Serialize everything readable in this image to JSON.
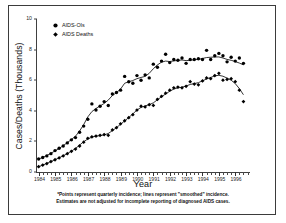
{
  "figure": {
    "title": "",
    "xlabel": "Year",
    "ylabel": "Cases/Deaths (Thousands)"
  },
  "legend": {
    "items": [
      {
        "label": "AIDS-OIs",
        "marker": "circle-marker",
        "color": "#000000"
      },
      {
        "label": "AIDS Deaths",
        "marker": "diamond-marker",
        "color": "#000000"
      }
    ]
  },
  "footnote": {
    "line1": "*Points represent quarterly incidence; lines represent \"smoothed\" incidence.",
    "line2": "Estimates are not adjusted for incomplete reporting of diagnosed AIDS cases."
  },
  "axes": {
    "y_ticks": [
      "0",
      "2",
      "4",
      "6",
      "8",
      "10"
    ],
    "x_ticks": [
      "1984",
      "1985",
      "1986",
      "1987",
      "1988",
      "1989",
      "1990",
      "1991",
      "1992",
      "1993",
      "1994",
      "1995",
      "1996"
    ]
  },
  "chart_data": {
    "type": "scatter",
    "title": "",
    "xlabel": "Year",
    "ylabel": "Cases/Deaths (Thousands)",
    "xlim": [
      1983.9,
      1996.9
    ],
    "ylim": [
      0,
      10
    ],
    "grid": false,
    "legend_position": "top-left",
    "note": "Quarterly incidence points with smoothed trend lines overlaid. x values are quarter midpoints in decimal years.",
    "x": [
      1984.0,
      1984.25,
      1984.5,
      1984.75,
      1985.0,
      1985.25,
      1985.5,
      1985.75,
      1986.0,
      1986.25,
      1986.5,
      1986.75,
      1987.0,
      1987.25,
      1987.5,
      1987.75,
      1988.0,
      1988.25,
      1988.5,
      1988.75,
      1989.0,
      1989.25,
      1989.5,
      1989.75,
      1990.0,
      1990.25,
      1990.5,
      1990.75,
      1991.0,
      1991.25,
      1991.5,
      1991.75,
      1992.0,
      1992.25,
      1992.5,
      1992.75,
      1993.0,
      1993.25,
      1993.5,
      1993.75,
      1994.0,
      1994.25,
      1994.5,
      1994.75,
      1995.0,
      1995.25,
      1995.5,
      1995.75,
      1996.0,
      1996.25,
      1996.5
    ],
    "series": [
      {
        "name": "AIDS-OIs",
        "marker": "circle",
        "color": "#000000",
        "values": [
          0.85,
          0.95,
          1.05,
          1.2,
          1.4,
          1.55,
          1.7,
          1.9,
          2.1,
          2.25,
          2.6,
          3.0,
          3.45,
          4.45,
          4.05,
          4.3,
          4.6,
          4.35,
          5.1,
          5.2,
          5.35,
          6.25,
          5.9,
          5.8,
          6.3,
          6.0,
          6.35,
          6.15,
          7.05,
          6.85,
          7.25,
          7.7,
          7.15,
          7.35,
          7.3,
          7.45,
          7.1,
          7.35,
          7.35,
          7.4,
          7.35,
          7.95,
          7.35,
          7.6,
          7.75,
          7.6,
          7.2,
          7.5,
          7.25,
          7.45,
          7.1
        ],
        "smoothed": [
          0.85,
          0.95,
          1.08,
          1.22,
          1.38,
          1.54,
          1.72,
          1.92,
          2.12,
          2.34,
          2.68,
          3.1,
          3.6,
          3.95,
          4.15,
          4.32,
          4.48,
          4.7,
          5.0,
          5.18,
          5.42,
          5.8,
          5.9,
          5.98,
          6.1,
          6.18,
          6.25,
          6.45,
          6.75,
          7.0,
          7.18,
          7.25,
          7.22,
          7.26,
          7.3,
          7.32,
          7.28,
          7.3,
          7.34,
          7.36,
          7.42,
          7.48,
          7.5,
          7.52,
          7.52,
          7.45,
          7.36,
          7.3,
          7.22,
          7.12,
          7.0
        ]
      },
      {
        "name": "AIDS Deaths",
        "marker": "diamond",
        "color": "#000000",
        "values": [
          0.35,
          0.45,
          0.55,
          0.68,
          0.8,
          0.92,
          1.05,
          1.2,
          1.35,
          1.5,
          1.7,
          1.95,
          2.2,
          2.3,
          2.35,
          2.4,
          2.45,
          2.4,
          2.75,
          2.9,
          3.15,
          3.35,
          3.55,
          3.75,
          4.05,
          4.3,
          4.25,
          4.4,
          4.35,
          4.75,
          4.95,
          5.15,
          5.35,
          5.5,
          5.55,
          5.5,
          5.6,
          5.9,
          5.75,
          5.7,
          5.95,
          6.15,
          6.1,
          6.3,
          6.45,
          6.0,
          6.05,
          6.1,
          5.9,
          5.35,
          4.6
        ],
        "smoothed": [
          0.35,
          0.45,
          0.56,
          0.68,
          0.8,
          0.93,
          1.06,
          1.2,
          1.36,
          1.54,
          1.76,
          1.98,
          2.16,
          2.28,
          2.34,
          2.38,
          2.42,
          2.52,
          2.7,
          2.9,
          3.12,
          3.34,
          3.56,
          3.8,
          4.05,
          4.22,
          4.32,
          4.4,
          4.52,
          4.72,
          4.92,
          5.1,
          5.28,
          5.42,
          5.5,
          5.54,
          5.62,
          5.72,
          5.78,
          5.84,
          5.96,
          6.08,
          6.18,
          6.28,
          6.32,
          6.26,
          6.14,
          6.0,
          5.78,
          5.45,
          5.05
        ]
      }
    ]
  }
}
